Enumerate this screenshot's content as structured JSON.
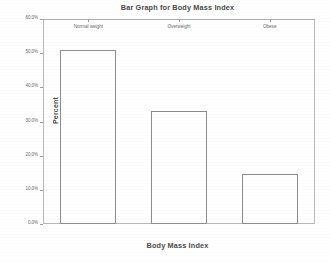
{
  "chart_data": {
    "type": "bar",
    "title": "Bar Graph for Body Mass Index",
    "xlabel": "Body Mass Index",
    "ylabel": "Percent",
    "categories": [
      "Normal weight",
      "Overweight",
      "Obese"
    ],
    "values": [
      51.0,
      33.0,
      14.5
    ],
    "value_labels": [
      "51.0%",
      "33.0%",
      "14.5%"
    ],
    "ylim": [
      0,
      60
    ],
    "ytick_values": [
      0,
      10,
      20,
      30,
      40,
      50,
      60
    ],
    "ytick_labels": [
      "0.0%",
      "10.0%",
      "20.0%",
      "30.0%",
      "40.0%",
      "50.0%",
      "60.0%"
    ],
    "grid": false,
    "legend": "none",
    "bar_fill_color": "#ffffff",
    "bar_border_color": "#8d8d8d",
    "axis_color": "#b9b9b9",
    "text_color": "#4a4a4a"
  }
}
